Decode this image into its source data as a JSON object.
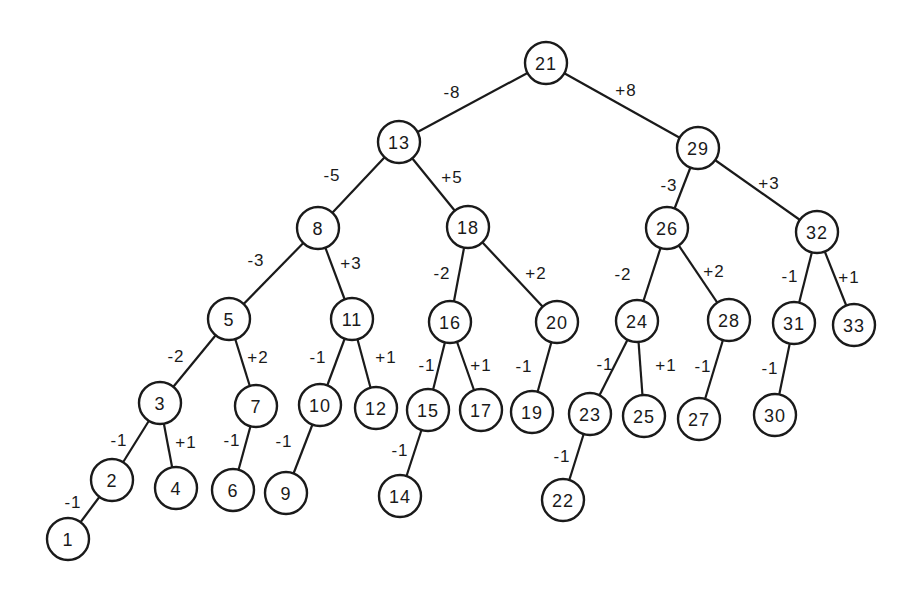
{
  "diagram": {
    "type": "binary-search-tree",
    "node_radius": 21,
    "colors": {
      "stroke": "#1a1a1a",
      "fill": "#ffffff",
      "background": "#ffffff"
    },
    "nodes": [
      {
        "id": "21",
        "label": "21",
        "x": 546,
        "y": 63
      },
      {
        "id": "13",
        "label": "13",
        "x": 399,
        "y": 142
      },
      {
        "id": "29",
        "label": "29",
        "x": 698,
        "y": 148
      },
      {
        "id": "8",
        "label": "8",
        "x": 318,
        "y": 228
      },
      {
        "id": "18",
        "label": "18",
        "x": 468,
        "y": 227
      },
      {
        "id": "26",
        "label": "26",
        "x": 667,
        "y": 228
      },
      {
        "id": "32",
        "label": "32",
        "x": 817,
        "y": 232
      },
      {
        "id": "5",
        "label": "5",
        "x": 229,
        "y": 319
      },
      {
        "id": "11",
        "label": "11",
        "x": 352,
        "y": 319
      },
      {
        "id": "16",
        "label": "16",
        "x": 450,
        "y": 322
      },
      {
        "id": "20",
        "label": "20",
        "x": 557,
        "y": 322
      },
      {
        "id": "24",
        "label": "24",
        "x": 637,
        "y": 321
      },
      {
        "id": "28",
        "label": "28",
        "x": 729,
        "y": 320
      },
      {
        "id": "31",
        "label": "31",
        "x": 794,
        "y": 323
      },
      {
        "id": "33",
        "label": "33",
        "x": 854,
        "y": 325
      },
      {
        "id": "3",
        "label": "3",
        "x": 160,
        "y": 403
      },
      {
        "id": "7",
        "label": "7",
        "x": 256,
        "y": 406
      },
      {
        "id": "10",
        "label": "10",
        "x": 320,
        "y": 405
      },
      {
        "id": "12",
        "label": "12",
        "x": 376,
        "y": 408
      },
      {
        "id": "15",
        "label": "15",
        "x": 428,
        "y": 410
      },
      {
        "id": "17",
        "label": "17",
        "x": 481,
        "y": 410
      },
      {
        "id": "19",
        "label": "19",
        "x": 532,
        "y": 412
      },
      {
        "id": "23",
        "label": "23",
        "x": 590,
        "y": 414
      },
      {
        "id": "25",
        "label": "25",
        "x": 644,
        "y": 416
      },
      {
        "id": "27",
        "label": "27",
        "x": 699,
        "y": 419
      },
      {
        "id": "30",
        "label": "30",
        "x": 775,
        "y": 415
      },
      {
        "id": "2",
        "label": "2",
        "x": 112,
        "y": 480
      },
      {
        "id": "4",
        "label": "4",
        "x": 176,
        "y": 488
      },
      {
        "id": "6",
        "label": "6",
        "x": 233,
        "y": 490
      },
      {
        "id": "9",
        "label": "9",
        "x": 286,
        "y": 493
      },
      {
        "id": "14",
        "label": "14",
        "x": 400,
        "y": 496
      },
      {
        "id": "22",
        "label": "22",
        "x": 563,
        "y": 500
      },
      {
        "id": "1",
        "label": "1",
        "x": 68,
        "y": 539
      }
    ],
    "edges": [
      {
        "from": "21",
        "to": "13",
        "label": "-8",
        "lx": 452,
        "ly": 92
      },
      {
        "from": "21",
        "to": "29",
        "label": "+8",
        "lx": 626,
        "ly": 90
      },
      {
        "from": "13",
        "to": "8",
        "label": "-5",
        "lx": 332,
        "ly": 175
      },
      {
        "from": "13",
        "to": "18",
        "label": "+5",
        "lx": 452,
        "ly": 177
      },
      {
        "from": "29",
        "to": "26",
        "label": "-3",
        "lx": 669,
        "ly": 185
      },
      {
        "from": "29",
        "to": "32",
        "label": "+3",
        "lx": 769,
        "ly": 183
      },
      {
        "from": "8",
        "to": "5",
        "label": "-3",
        "lx": 256,
        "ly": 260
      },
      {
        "from": "8",
        "to": "11",
        "label": "+3",
        "lx": 351,
        "ly": 263
      },
      {
        "from": "18",
        "to": "16",
        "label": "-2",
        "lx": 442,
        "ly": 273
      },
      {
        "from": "18",
        "to": "20",
        "label": "+2",
        "lx": 536,
        "ly": 273
      },
      {
        "from": "26",
        "to": "24",
        "label": "-2",
        "lx": 623,
        "ly": 274
      },
      {
        "from": "26",
        "to": "28",
        "label": "+2",
        "lx": 714,
        "ly": 271
      },
      {
        "from": "32",
        "to": "31",
        "label": "-1",
        "lx": 790,
        "ly": 276
      },
      {
        "from": "32",
        "to": "33",
        "label": "+1",
        "lx": 849,
        "ly": 277
      },
      {
        "from": "5",
        "to": "3",
        "label": "-2",
        "lx": 176,
        "ly": 356
      },
      {
        "from": "5",
        "to": "7",
        "label": "+2",
        "lx": 258,
        "ly": 357
      },
      {
        "from": "11",
        "to": "10",
        "label": "-1",
        "lx": 318,
        "ly": 357
      },
      {
        "from": "11",
        "to": "12",
        "label": "+1",
        "lx": 386,
        "ly": 357
      },
      {
        "from": "16",
        "to": "15",
        "label": "-1",
        "lx": 427,
        "ly": 365
      },
      {
        "from": "16",
        "to": "17",
        "label": "+1",
        "lx": 481,
        "ly": 365
      },
      {
        "from": "20",
        "to": "19",
        "label": "-1",
        "lx": 524,
        "ly": 366
      },
      {
        "from": "24",
        "to": "23",
        "label": "-1",
        "lx": 605,
        "ly": 364
      },
      {
        "from": "24",
        "to": "25",
        "label": "+1",
        "lx": 666,
        "ly": 365
      },
      {
        "from": "28",
        "to": "27",
        "label": "-1",
        "lx": 703,
        "ly": 366
      },
      {
        "from": "31",
        "to": "30",
        "label": "-1",
        "lx": 770,
        "ly": 368
      },
      {
        "from": "3",
        "to": "2",
        "label": "-1",
        "lx": 119,
        "ly": 440
      },
      {
        "from": "3",
        "to": "4",
        "label": "+1",
        "lx": 186,
        "ly": 442
      },
      {
        "from": "7",
        "to": "6",
        "label": "-1",
        "lx": 232,
        "ly": 440
      },
      {
        "from": "10",
        "to": "9",
        "label": "-1",
        "lx": 284,
        "ly": 441
      },
      {
        "from": "15",
        "to": "14",
        "label": "-1",
        "lx": 400,
        "ly": 450
      },
      {
        "from": "23",
        "to": "22",
        "label": "-1",
        "lx": 562,
        "ly": 456
      },
      {
        "from": "2",
        "to": "1",
        "label": "-1",
        "lx": 73,
        "ly": 502
      }
    ]
  }
}
